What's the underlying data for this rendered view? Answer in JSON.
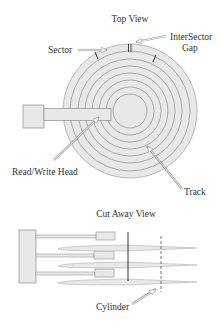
{
  "diagram": {
    "top_view": {
      "title": "Top View",
      "labels": {
        "sector": "Sector",
        "intersector_gap_line1": "InterSector",
        "intersector_gap_line2": "Gap",
        "read_write_head": "Read/Write Head",
        "track": "Track"
      },
      "disk": {
        "center_x": 130,
        "center_y": 111,
        "outer_radius": 67,
        "track_count": 7
      }
    },
    "cut_away_view": {
      "title": "Cut Away View",
      "labels": {
        "cylinder": "Cylinder"
      },
      "platter_count": 3,
      "head_count": 3
    },
    "colors": {
      "fill": "#e8e8e8",
      "stroke": "#9a9a9a",
      "dark_line": "#333333",
      "text": "#333333"
    }
  }
}
